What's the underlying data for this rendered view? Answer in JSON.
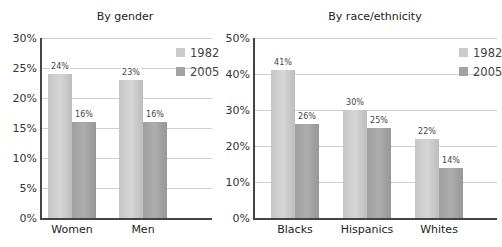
{
  "chart_data": [
    {
      "type": "bar",
      "title": "By gender",
      "categories": [
        "Women",
        "Men"
      ],
      "series": [
        {
          "name": "1982",
          "values": [
            24,
            23
          ],
          "color": "#cbcbcb"
        },
        {
          "name": "2005",
          "values": [
            16,
            16
          ],
          "color": "#a3a3a3"
        }
      ],
      "value_labels": [
        [
          "24%",
          "23%"
        ],
        [
          "16%",
          "16%"
        ]
      ],
      "yticks": [
        "0%",
        "5%",
        "10%",
        "15%",
        "20%",
        "25%",
        "30%"
      ],
      "ylim": [
        0,
        30
      ],
      "xlabel": "",
      "ylabel": "",
      "grid": true,
      "legend_position": "top-right"
    },
    {
      "type": "bar",
      "title": "By race/ethnicity",
      "categories": [
        "Blacks",
        "Hispanics",
        "Whites"
      ],
      "series": [
        {
          "name": "1982",
          "values": [
            41,
            30,
            22
          ],
          "color": "#cbcbcb"
        },
        {
          "name": "2005",
          "values": [
            26,
            25,
            14
          ],
          "color": "#a3a3a3"
        }
      ],
      "value_labels": [
        [
          "41%",
          "30%",
          "22%"
        ],
        [
          "26%",
          "25%",
          "14%"
        ]
      ],
      "yticks": [
        "0%",
        "10%",
        "20%",
        "30%",
        "40%",
        "50%"
      ],
      "ylim": [
        0,
        50
      ],
      "xlabel": "",
      "ylabel": "",
      "grid": true,
      "legend_position": "top-right"
    }
  ]
}
